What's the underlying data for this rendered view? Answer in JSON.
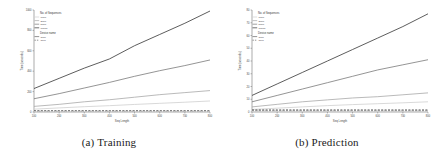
{
  "figure": {
    "panels": [
      {
        "caption": "(a) Training",
        "chart_index": 0
      },
      {
        "caption": "(b) Prediction",
        "chart_index": 1
      }
    ]
  },
  "chart_data": [
    {
      "type": "line",
      "title": "",
      "xlabel": "Seq Length",
      "ylabel": "Time (seconds)",
      "x": [
        100,
        200,
        300,
        400,
        500,
        600,
        700,
        800
      ],
      "xlim": [
        100,
        800
      ],
      "ylim": [
        0,
        1000
      ],
      "yticks": [
        0,
        200,
        400,
        600,
        800,
        1000
      ],
      "xticks": [
        100,
        200,
        300,
        400,
        500,
        600,
        700,
        800
      ],
      "grid": false,
      "legend_position": "upper-left",
      "legend_groups": [
        {
          "title": "No. of Sequences",
          "entries": [
            {
              "label": "1000",
              "color": "#cfcfcf"
            },
            {
              "label": "2000",
              "color": "#a8a8a8"
            },
            {
              "label": "5000",
              "color": "#7a7a7a"
            },
            {
              "label": "10000",
              "color": "#333333"
            }
          ]
        },
        {
          "title": "Device name",
          "entries": [
            {
              "label": "GPU",
              "color": "#666666",
              "dash": "solid"
            },
            {
              "label": "CPU",
              "color": "#666666",
              "dash": "dashed"
            }
          ]
        }
      ],
      "series": [
        {
          "name": "10000 GPU",
          "color": "#333333",
          "dash": "solid",
          "values": [
            230,
            330,
            430,
            520,
            650,
            760,
            870,
            990
          ]
        },
        {
          "name": "5000 GPU",
          "color": "#7a7a7a",
          "dash": "solid",
          "values": [
            130,
            180,
            235,
            290,
            350,
            405,
            455,
            510
          ]
        },
        {
          "name": "2000 GPU",
          "color": "#a8a8a8",
          "dash": "solid",
          "values": [
            55,
            75,
            100,
            120,
            145,
            170,
            190,
            210
          ]
        },
        {
          "name": "1000 GPU",
          "color": "#cfcfcf",
          "dash": "solid",
          "values": [
            28,
            40,
            52,
            62,
            74,
            85,
            96,
            108
          ]
        },
        {
          "name": "10000 CPU",
          "color": "#333333",
          "dash": "dashed",
          "values": [
            12,
            12,
            12,
            12,
            12,
            12,
            12,
            12
          ]
        },
        {
          "name": "5000 CPU",
          "color": "#7a7a7a",
          "dash": "dashed",
          "values": [
            8,
            8,
            8,
            8,
            8,
            8,
            8,
            8
          ]
        },
        {
          "name": "2000 CPU",
          "color": "#a8a8a8",
          "dash": "dashed",
          "values": [
            5,
            5,
            5,
            5,
            5,
            5,
            5,
            5
          ]
        },
        {
          "name": "1000 CPU",
          "color": "#cfcfcf",
          "dash": "dashed",
          "values": [
            3,
            3,
            3,
            3,
            3,
            3,
            3,
            3
          ]
        }
      ]
    },
    {
      "type": "line",
      "title": "",
      "xlabel": "Seq Length",
      "ylabel": "Time (seconds)",
      "x": [
        100,
        200,
        300,
        400,
        500,
        600,
        700,
        800
      ],
      "xlim": [
        100,
        800
      ],
      "ylim": [
        0,
        80
      ],
      "yticks": [
        0,
        10,
        20,
        30,
        40,
        50,
        60,
        70,
        80
      ],
      "xticks": [
        100,
        200,
        300,
        400,
        500,
        600,
        700,
        800
      ],
      "grid": false,
      "legend_position": "upper-left",
      "legend_groups": [
        {
          "title": "No. of Sequences",
          "entries": [
            {
              "label": "1000",
              "color": "#cfcfcf"
            },
            {
              "label": "2000",
              "color": "#a8a8a8"
            },
            {
              "label": "5000",
              "color": "#7a7a7a"
            },
            {
              "label": "10000",
              "color": "#333333"
            }
          ]
        },
        {
          "title": "Device name",
          "entries": [
            {
              "label": "GPU",
              "color": "#666666",
              "dash": "solid"
            },
            {
              "label": "CPU",
              "color": "#666666",
              "dash": "dashed"
            }
          ]
        }
      ],
      "series": [
        {
          "name": "10000 GPU",
          "color": "#333333",
          "dash": "solid",
          "values": [
            13,
            22,
            31,
            40,
            49,
            58,
            67,
            77
          ]
        },
        {
          "name": "5000 GPU",
          "color": "#7a7a7a",
          "dash": "solid",
          "values": [
            8,
            13,
            18,
            23,
            28,
            33,
            37,
            41
          ]
        },
        {
          "name": "2000 GPU",
          "color": "#a8a8a8",
          "dash": "solid",
          "values": [
            4,
            6,
            8,
            9.5,
            11,
            12,
            13.5,
            15
          ]
        },
        {
          "name": "1000 GPU",
          "color": "#cfcfcf",
          "dash": "solid",
          "values": [
            2,
            3,
            4,
            5,
            5.8,
            6.5,
            7.2,
            8
          ]
        },
        {
          "name": "10000 CPU",
          "color": "#333333",
          "dash": "dashed",
          "values": [
            1.6,
            1.6,
            1.6,
            1.6,
            1.6,
            1.6,
            1.6,
            1.6
          ]
        },
        {
          "name": "5000 CPU",
          "color": "#7a7a7a",
          "dash": "dashed",
          "values": [
            1.1,
            1.1,
            1.1,
            1.1,
            1.1,
            1.1,
            1.1,
            1.1
          ]
        },
        {
          "name": "2000 CPU",
          "color": "#a8a8a8",
          "dash": "dashed",
          "values": [
            0.7,
            0.7,
            0.7,
            0.7,
            0.7,
            0.7,
            0.7,
            0.7
          ]
        },
        {
          "name": "1000 CPU",
          "color": "#cfcfcf",
          "dash": "dashed",
          "values": [
            0.4,
            0.4,
            0.4,
            0.4,
            0.4,
            0.4,
            0.4,
            0.4
          ]
        }
      ]
    }
  ]
}
